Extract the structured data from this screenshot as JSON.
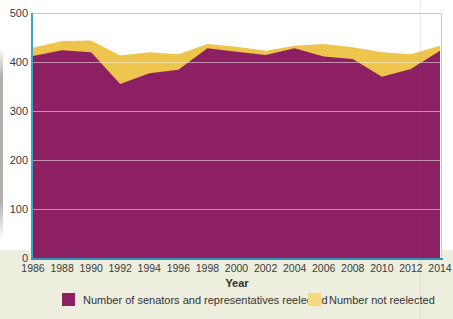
{
  "figure": {
    "title": "",
    "xlabel": "Year",
    "legend": [
      {
        "label": "Number of senators and representatives reelected",
        "swatch_color": "#8c2062"
      },
      {
        "label": "Number not reelected",
        "swatch_color": "#f6d87f"
      }
    ]
  },
  "chart_data": {
    "type": "area",
    "stacked": true,
    "x": [
      1986,
      1988,
      1990,
      1992,
      1994,
      1996,
      1998,
      2000,
      2002,
      2004,
      2006,
      2008,
      2010,
      2012,
      2014
    ],
    "series": [
      {
        "name": "Number of senators and representatives reelected",
        "values": [
          412,
          424,
          420,
          355,
          377,
          384,
          428,
          421,
          414,
          428,
          411,
          406,
          370,
          386,
          423
        ],
        "color": "#8c2062"
      },
      {
        "name": "Number not reelected",
        "values": [
          17,
          19,
          24,
          58,
          43,
          32,
          9,
          10,
          9,
          5,
          26,
          24,
          50,
          30,
          10
        ],
        "color": "#edc44c"
      }
    ],
    "title": "",
    "xlabel": "Year",
    "ylabel": "",
    "ylim": [
      0,
      500
    ],
    "yticks": [
      0,
      100,
      200,
      300,
      400,
      500
    ],
    "xticks": [
      1986,
      1988,
      1990,
      1992,
      1994,
      1996,
      1998,
      2000,
      2002,
      2004,
      2006,
      2008,
      2010,
      2012,
      2014
    ],
    "grid": true,
    "legend_position": "bottom"
  },
  "colors": {
    "area_reelected": "#8c2062",
    "area_not_reelected": "#edc44c",
    "legend_not_reelected_swatch": "#f6d87f",
    "axis_line": "#3fa6c8",
    "gridline": "#c8c8c8",
    "tick_text": "#3a3a3a",
    "page_band": "#edeedd"
  }
}
